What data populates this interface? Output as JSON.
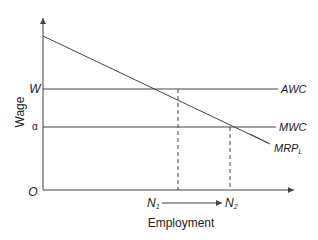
{
  "diagram": {
    "y_axis_label": "Wage",
    "x_axis_label": "Employment",
    "origin_label": "O",
    "wage_levels": [
      {
        "label": "W",
        "curve": "AWC"
      },
      {
        "label": "α",
        "curve": "MWC"
      }
    ],
    "demand_curve": {
      "label": "MRP",
      "subscript": "L"
    },
    "employment_levels": [
      {
        "label": "N",
        "subscript": "1"
      },
      {
        "label": "N",
        "subscript": "2"
      }
    ],
    "colors": {
      "line": "#444444",
      "text": "#222222"
    }
  }
}
